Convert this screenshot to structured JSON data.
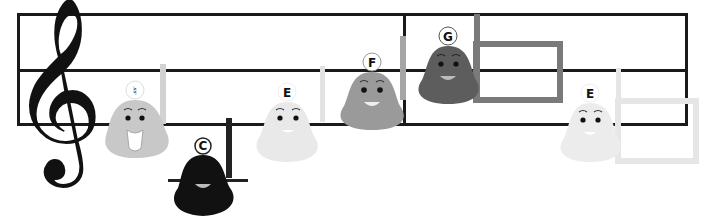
{
  "scene": {
    "description": "Treble clef staff with cartoon hand-bell notes",
    "clef_glyph": "𝄞",
    "bells": [
      {
        "label": "♮",
        "color": "#c8c8c8",
        "handle_color": "#d2d2d2",
        "expression": "finger-on-lips"
      },
      {
        "label": "C",
        "color": "#111111",
        "handle_color": "#222222",
        "expression": "smile"
      },
      {
        "label": "E",
        "color": "#e9e9e9",
        "handle_color": "#e2e2e2",
        "expression": "smile"
      },
      {
        "label": "F",
        "color": "#9a9a9a",
        "handle_color": "#a5a5a5",
        "expression": "smile"
      },
      {
        "label": "G",
        "color": "#5d5d5d",
        "handle_color": "#7a7a7a",
        "expression": "smile"
      },
      {
        "label": "E",
        "color": "#ececec",
        "handle_color": "#e6e6e6",
        "expression": "smile"
      }
    ]
  }
}
